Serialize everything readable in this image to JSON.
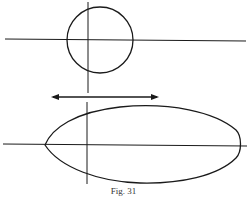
{
  "figure": {
    "caption": "Fig. 31",
    "stroke_color": "#1a1a1a",
    "elements": {
      "top_circle": {
        "cx": 100,
        "cy": 40,
        "r": 33
      },
      "top_horizontal_axis": {
        "x1": 5,
        "y1": 39,
        "x2": 246,
        "y2": 41
      },
      "top_vertical_axis": {
        "x1": 88,
        "y1": 2,
        "x2": 88,
        "y2": 93
      },
      "double_arrow": {
        "x1": 51,
        "y1": 97,
        "x2": 159,
        "y2": 97
      },
      "bottom_horizontal_axis": {
        "x1": 3,
        "y1": 144,
        "x2": 247,
        "y2": 146
      },
      "bottom_vertical_axis": {
        "x1": 87,
        "y1": 102,
        "x2": 87,
        "y2": 184
      },
      "bottom_ellipse_egg": {
        "left_x": 45,
        "right_x": 240,
        "center_y": 145,
        "top_y": 106,
        "bottom_y": 183
      }
    }
  }
}
